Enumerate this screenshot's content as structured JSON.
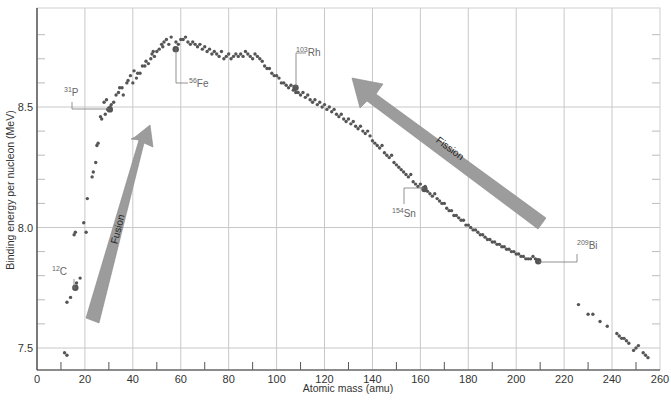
{
  "chart_data": {
    "type": "scatter",
    "title": "",
    "xlabel": "Atomic mass (amu)",
    "ylabel": "Binding energy per nucleon (MeV)",
    "xlim": [
      0,
      260
    ],
    "ylim": [
      7.41,
      8.91
    ],
    "x_ticks": [
      0,
      20,
      40,
      60,
      80,
      100,
      120,
      140,
      160,
      180,
      200,
      220,
      240,
      260
    ],
    "y_ticks": [
      7.5,
      8.0,
      8.5
    ],
    "y_tick_labels": [
      "7.5",
      "8.0",
      "8.5"
    ],
    "grid": true,
    "legend": null,
    "colors": {
      "point": "#555555",
      "grid": "#c8c8c8",
      "axis": "#333333",
      "arrow": "#9a9a9a",
      "arrow_edge": "#808080",
      "leader": "#777777"
    },
    "labeled_points": [
      {
        "label": "C",
        "mass_number": "12",
        "x": 16,
        "y": 7.75,
        "label_x": 52,
        "label_y": 275,
        "leader": [
          [
            74,
            279
          ],
          [
            74,
            288
          ],
          [
            76,
            288
          ]
        ]
      },
      {
        "label": "P",
        "mass_number": "31",
        "x": 30.4,
        "y": 8.49,
        "label_x": 64,
        "label_y": 96,
        "leader": [
          [
            72,
            102
          ],
          [
            72,
            109
          ],
          [
            110,
            109
          ]
        ]
      },
      {
        "label": "Fe",
        "mass_number": "56",
        "x": 57.9,
        "y": 8.74,
        "label_x": 189,
        "label_y": 87,
        "leader": [
          [
            176,
            48
          ],
          [
            176,
            83
          ],
          [
            188,
            83
          ]
        ]
      },
      {
        "label": "Rh",
        "mass_number": "103",
        "x": 107.9,
        "y": 8.58,
        "label_x": 296,
        "label_y": 56,
        "leader": [
          [
            296,
            87
          ],
          [
            296,
            53
          ],
          [
            306,
            53
          ]
        ]
      },
      {
        "label": "Sn",
        "mass_number": "154",
        "x": 161.7,
        "y": 8.16,
        "label_x": 392,
        "label_y": 217,
        "leader": [
          [
            424,
            188
          ],
          [
            404,
            188
          ],
          [
            404,
            204
          ]
        ]
      },
      {
        "label": "Bi",
        "mass_number": "209",
        "x": 209.2,
        "y": 7.86,
        "label_x": 577,
        "label_y": 249,
        "leader": [
          [
            539,
            262
          ],
          [
            577,
            262
          ],
          [
            577,
            254
          ]
        ]
      }
    ],
    "series": [
      {
        "name": "nuclides",
        "points": [
          [
            11.5,
            7.48
          ],
          [
            12.5,
            7.47
          ],
          [
            12.5,
            7.69
          ],
          [
            14,
            7.71
          ],
          [
            16.5,
            7.77
          ],
          [
            18,
            7.79
          ],
          [
            15.5,
            7.97
          ],
          [
            16,
            7.98
          ],
          [
            19.5,
            8.02
          ],
          [
            20.5,
            7.98
          ],
          [
            21,
            8.12
          ],
          [
            23,
            8.21
          ],
          [
            23.5,
            8.23
          ],
          [
            24.5,
            8.27
          ],
          [
            25,
            8.34
          ],
          [
            25.5,
            8.35
          ],
          [
            27,
            8.45
          ],
          [
            26.5,
            8.46
          ],
          [
            28.5,
            8.47
          ],
          [
            29.5,
            8.49
          ],
          [
            30.5,
            8.5
          ],
          [
            31,
            8.51
          ],
          [
            29,
            8.53
          ],
          [
            28,
            8.52
          ],
          [
            32,
            8.52
          ],
          [
            33,
            8.55
          ],
          [
            34,
            8.56
          ],
          [
            35.5,
            8.58
          ],
          [
            36,
            8.55
          ],
          [
            34.5,
            8.58
          ],
          [
            37.5,
            8.6
          ],
          [
            38,
            8.61
          ],
          [
            39,
            8.63
          ],
          [
            40,
            8.6
          ],
          [
            40.5,
            8.65
          ],
          [
            41.5,
            8.62
          ],
          [
            42,
            8.64
          ],
          [
            43,
            8.64
          ],
          [
            44,
            8.67
          ],
          [
            45,
            8.67
          ],
          [
            45.5,
            8.69
          ],
          [
            46.5,
            8.68
          ],
          [
            47.5,
            8.7
          ],
          [
            48,
            8.72
          ],
          [
            48.5,
            8.73
          ],
          [
            49,
            8.71
          ],
          [
            50,
            8.73
          ],
          [
            51,
            8.74
          ],
          [
            52,
            8.76
          ],
          [
            52.5,
            8.75
          ],
          [
            53,
            8.77
          ],
          [
            54,
            8.78
          ],
          [
            55,
            8.76
          ],
          [
            56,
            8.79
          ],
          [
            58,
            8.77
          ],
          [
            59,
            8.76
          ],
          [
            60,
            8.78
          ],
          [
            61,
            8.78
          ],
          [
            62,
            8.79
          ],
          [
            63,
            8.77
          ],
          [
            64,
            8.76
          ],
          [
            65,
            8.77
          ],
          [
            66,
            8.76
          ],
          [
            67,
            8.75
          ],
          [
            68,
            8.76
          ],
          [
            69,
            8.74
          ],
          [
            70,
            8.75
          ],
          [
            71,
            8.73
          ],
          [
            72,
            8.74
          ],
          [
            73,
            8.72
          ],
          [
            74,
            8.73
          ],
          [
            75,
            8.72
          ],
          [
            76,
            8.71
          ],
          [
            77,
            8.73
          ],
          [
            78,
            8.7
          ],
          [
            79,
            8.71
          ],
          [
            80,
            8.72
          ],
          [
            81,
            8.7
          ],
          [
            82,
            8.71
          ],
          [
            83,
            8.72
          ],
          [
            84,
            8.71
          ],
          [
            85,
            8.72
          ],
          [
            86,
            8.71
          ],
          [
            87,
            8.73
          ],
          [
            88,
            8.72
          ],
          [
            89,
            8.71
          ],
          [
            90,
            8.7
          ],
          [
            91,
            8.72
          ],
          [
            92,
            8.71
          ],
          [
            93,
            8.7
          ],
          [
            94,
            8.69
          ],
          [
            95,
            8.67
          ],
          [
            96,
            8.66
          ],
          [
            97,
            8.66
          ],
          [
            98,
            8.64
          ],
          [
            99,
            8.63
          ],
          [
            100,
            8.63
          ],
          [
            101,
            8.62
          ],
          [
            102,
            8.6
          ],
          [
            103,
            8.6
          ],
          [
            104,
            8.59
          ],
          [
            105,
            8.58
          ],
          [
            106,
            8.59
          ],
          [
            107,
            8.57
          ],
          [
            108,
            8.56
          ],
          [
            109,
            8.56
          ],
          [
            110,
            8.55
          ],
          [
            111,
            8.56
          ],
          [
            112,
            8.54
          ],
          [
            113,
            8.55
          ],
          [
            114,
            8.53
          ],
          [
            115,
            8.52
          ],
          [
            116,
            8.53
          ],
          [
            117,
            8.51
          ],
          [
            118,
            8.52
          ],
          [
            119,
            8.5
          ],
          [
            120,
            8.51
          ],
          [
            121,
            8.49
          ],
          [
            122,
            8.5
          ],
          [
            123,
            8.48
          ],
          [
            124,
            8.49
          ],
          [
            125,
            8.47
          ],
          [
            126,
            8.46
          ],
          [
            127,
            8.47
          ],
          [
            128,
            8.45
          ],
          [
            129,
            8.44
          ],
          [
            130,
            8.45
          ],
          [
            131,
            8.43
          ],
          [
            132,
            8.44
          ],
          [
            133,
            8.42
          ],
          [
            134,
            8.41
          ],
          [
            135,
            8.42
          ],
          [
            136,
            8.4
          ],
          [
            137,
            8.39
          ],
          [
            138,
            8.4
          ],
          [
            139,
            8.38
          ],
          [
            140,
            8.36
          ],
          [
            141,
            8.35
          ],
          [
            142,
            8.34
          ],
          [
            143,
            8.33
          ],
          [
            144,
            8.34
          ],
          [
            145,
            8.31
          ],
          [
            146,
            8.3
          ],
          [
            147,
            8.29
          ],
          [
            148,
            8.3
          ],
          [
            149,
            8.27
          ],
          [
            150,
            8.26
          ],
          [
            151,
            8.25
          ],
          [
            152,
            8.24
          ],
          [
            153,
            8.23
          ],
          [
            154,
            8.22
          ],
          [
            155,
            8.21
          ],
          [
            156,
            8.22
          ],
          [
            157,
            8.19
          ],
          [
            158,
            8.18
          ],
          [
            159,
            8.17
          ],
          [
            160,
            8.18
          ],
          [
            162,
            8.17
          ],
          [
            163,
            8.15
          ],
          [
            164,
            8.14
          ],
          [
            165,
            8.13
          ],
          [
            166,
            8.14
          ],
          [
            167,
            8.12
          ],
          [
            168,
            8.11
          ],
          [
            169,
            8.1
          ],
          [
            170,
            8.1
          ],
          [
            171,
            8.08
          ],
          [
            172,
            8.07
          ],
          [
            173,
            8.07
          ],
          [
            174,
            8.05
          ],
          [
            175,
            8.05
          ],
          [
            176,
            8.04
          ],
          [
            177,
            8.03
          ],
          [
            178,
            8.03
          ],
          [
            179,
            8.01
          ],
          [
            180,
            8.01
          ],
          [
            181,
            8.0
          ],
          [
            182,
            7.99
          ],
          [
            183,
            7.99
          ],
          [
            184,
            7.98
          ],
          [
            185,
            7.97
          ],
          [
            186,
            7.97
          ],
          [
            187,
            7.96
          ],
          [
            188,
            7.95
          ],
          [
            189,
            7.95
          ],
          [
            190,
            7.94
          ],
          [
            191,
            7.94
          ],
          [
            192,
            7.93
          ],
          [
            193,
            7.93
          ],
          [
            194,
            7.92
          ],
          [
            195,
            7.92
          ],
          [
            196,
            7.91
          ],
          [
            197,
            7.91
          ],
          [
            198,
            7.9
          ],
          [
            199,
            7.9
          ],
          [
            200,
            7.89
          ],
          [
            201,
            7.89
          ],
          [
            202,
            7.88
          ],
          [
            203,
            7.88
          ],
          [
            204,
            7.87
          ],
          [
            205,
            7.87
          ],
          [
            206,
            7.87
          ],
          [
            207,
            7.88
          ],
          [
            208,
            7.87
          ],
          [
            226,
            7.68
          ],
          [
            230,
            7.64
          ],
          [
            232,
            7.64
          ],
          [
            235,
            7.61
          ],
          [
            238,
            7.59
          ],
          [
            242,
            7.56
          ],
          [
            243,
            7.55
          ],
          [
            244,
            7.54
          ],
          [
            245,
            7.54
          ],
          [
            246,
            7.53
          ],
          [
            247,
            7.52
          ],
          [
            249,
            7.49
          ],
          [
            250,
            7.5
          ],
          [
            251,
            7.51
          ],
          [
            253,
            7.48
          ],
          [
            254,
            7.47
          ],
          [
            255,
            7.46
          ]
        ]
      }
    ],
    "annotations": [
      {
        "text": "Fusion",
        "type": "arrow",
        "direction": "up-right",
        "tail": [
          93,
          322
        ],
        "head": [
          150,
          125
        ]
      },
      {
        "text": "Fission",
        "type": "arrow",
        "direction": "up-left",
        "tail": [
          543,
          222
        ],
        "head": [
          352,
          78
        ]
      }
    ]
  },
  "axes": {
    "xlabel": "Atomic mass (amu)",
    "ylabel": "Binding energy per nucleon (MeV)"
  },
  "arrows": {
    "fusion": "Fusion",
    "fission": "Fission"
  }
}
